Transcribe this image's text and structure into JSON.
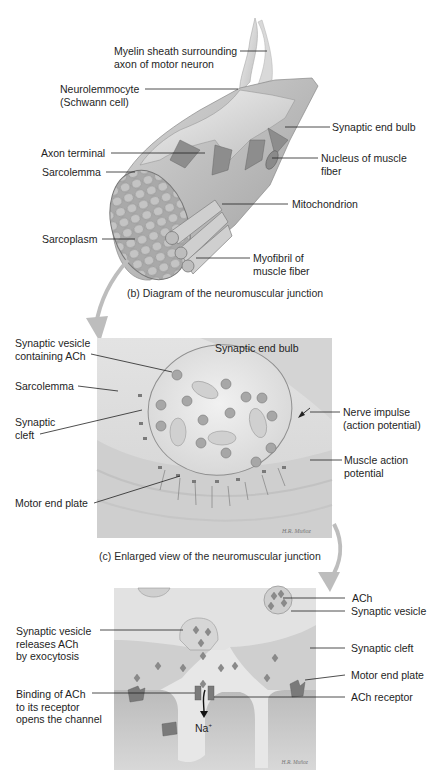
{
  "panel_b": {
    "caption": "(b) Diagram of the neuromuscular junction",
    "labels": {
      "myelin_1": "Myelin sheath surrounding",
      "myelin_2": "axon of motor neuron",
      "neuro_1": "Neurolemmocyte",
      "neuro_2": "(Schwann cell)",
      "synaptic_end_bulb": "Synaptic end bulb",
      "axon_terminal": "Axon terminal",
      "sarcolemma": "Sarcolemma",
      "nucleus_1": "Nucleus of muscle",
      "nucleus_2": "fiber",
      "mitochondrion": "Mitochondrion",
      "sarcoplasm": "Sarcoplasm",
      "myofibril_1": "Myofibril of",
      "myofibril_2": "muscle fiber"
    }
  },
  "panel_c": {
    "caption": "(c) Enlarged view of the neuromuscular junction",
    "labels": {
      "vesicle_1": "Synaptic vesicle",
      "vesicle_2": "containing ACh",
      "end_bulb": "Synaptic end bulb",
      "sarcolemma": "Sarcolemma",
      "cleft_1": "Synaptic",
      "cleft_2": "cleft",
      "nerve_1": "Nerve impulse",
      "nerve_2": "(action potential)",
      "muscle_ap_1": "Muscle action",
      "muscle_ap_2": "potential",
      "motor_end_plate": "Motor end plate"
    },
    "signature": "H.R. Muñoz"
  },
  "panel_d": {
    "labels": {
      "ach": "ACh",
      "synaptic_vesicle": "Synaptic vesicle",
      "releases_1": "Synaptic vesicle",
      "releases_2": "releases ACh",
      "releases_3": "by exocytosis",
      "synaptic_cleft": "Synaptic cleft",
      "motor_end_plate": "Motor end plate",
      "binding_1": "Binding of ACh",
      "binding_2": "to its receptor",
      "binding_3": "opens the channel",
      "ach_receptor": "ACh receptor",
      "na": "Na",
      "na_sup": "+"
    },
    "signature": "H.R. Muñoz"
  },
  "colors": {
    "tissue_light": "#e6e6e6",
    "tissue_mid": "#c9c9c9",
    "tissue_dark": "#9a9a9a",
    "receptor": "#7a7a7a",
    "arrow_gray": "#b5b5b5",
    "leader": "#222222"
  }
}
